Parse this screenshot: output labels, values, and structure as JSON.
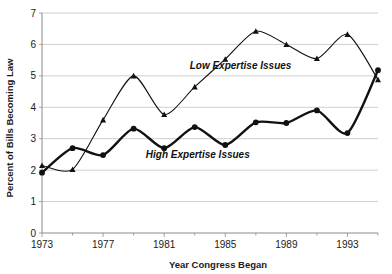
{
  "chart_data": {
    "type": "line",
    "title": "",
    "xlabel": "Year Congress Began",
    "ylabel": "Percent of Bills Becoming Law",
    "x": [
      1973,
      1975,
      1977,
      1979,
      1981,
      1983,
      1985,
      1987,
      1989,
      1991,
      1993,
      1995
    ],
    "xlim": [
      1973,
      1995
    ],
    "ylim": [
      0,
      7
    ],
    "ytick_labels": [
      "0",
      "1",
      "2",
      "3",
      "4",
      "5",
      "6",
      "7"
    ],
    "yticks": [
      0,
      1,
      2,
      3,
      4,
      5,
      6,
      7
    ],
    "xtick_labels": [
      "1973",
      "1977",
      "1981",
      "1985",
      "1989",
      "1993"
    ],
    "xticks_major": [
      1973,
      1977,
      1981,
      1985,
      1989,
      1993
    ],
    "xticks_minor": [
      1975,
      1979,
      1983,
      1987,
      1991,
      1995
    ],
    "grid": "horizontal",
    "legend_position": "inline-annotations",
    "series": [
      {
        "name": "Low Expertise Issues",
        "marker": "triangle",
        "line_width": "thin",
        "color": "#111111",
        "values": [
          2.15,
          2.02,
          3.6,
          5.0,
          3.77,
          4.65,
          5.53,
          6.42,
          6.0,
          5.55,
          6.32,
          4.88
        ]
      },
      {
        "name": "High Expertise Issues",
        "marker": "circle",
        "line_width": "thick",
        "color": "#111111",
        "values": [
          1.92,
          2.7,
          2.48,
          3.32,
          2.7,
          3.37,
          2.8,
          3.52,
          3.5,
          3.9,
          3.18,
          5.18
        ]
      }
    ],
    "annotations": [
      {
        "text": "Low Expertise Issues",
        "x": 1986.0,
        "y": 5.22
      },
      {
        "text": "High Expertise Issues",
        "x": 1983.2,
        "y": 2.38
      }
    ]
  }
}
